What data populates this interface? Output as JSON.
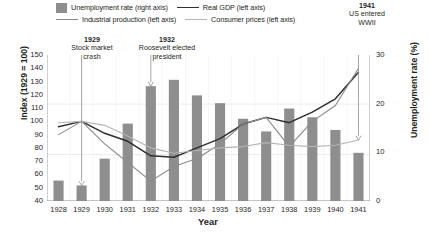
{
  "chart_data": {
    "type": "bar",
    "title": "",
    "xlabel": "Year",
    "ylabel": "Index (1929 = 100)",
    "ylabel_right": "Unemployment rate (%)",
    "categories": [
      "1928",
      "1929",
      "1930",
      "1931",
      "1932",
      "1933",
      "1934",
      "1935",
      "1936",
      "1937",
      "1938",
      "1939",
      "1940",
      "1941"
    ],
    "ylim": [
      40,
      150
    ],
    "ylim_right": [
      0,
      30
    ],
    "yticks": [
      40,
      50,
      60,
      70,
      80,
      90,
      100,
      110,
      120,
      130,
      140,
      150
    ],
    "yticks_right": [
      0,
      10,
      20,
      30
    ],
    "grid": true,
    "legend_position": "top",
    "series": [
      {
        "name": "Unemployment rate (right axis)",
        "type": "bar",
        "axis": "right",
        "color": "#8e8e8e",
        "values": [
          4.2,
          3.2,
          8.7,
          15.9,
          23.6,
          24.9,
          21.7,
          20.1,
          16.9,
          14.3,
          19.0,
          17.2,
          14.6,
          9.9
        ]
      },
      {
        "name": "Real GDP (left axis)",
        "type": "line",
        "axis": "left",
        "color": "#2f2f2f",
        "values": [
          96,
          100,
          91,
          85,
          74,
          73,
          80,
          87,
          98,
          103,
          99,
          107,
          117,
          137
        ]
      },
      {
        "name": "Industrial production (left axis)",
        "type": "line",
        "axis": "left",
        "color": "#8a8a8a",
        "values": [
          90,
          100,
          83,
          69,
          55,
          66,
          72,
          83,
          98,
          103,
          81,
          100,
          112,
          140
        ]
      },
      {
        "name": "Consumer prices (left axis)",
        "type": "line",
        "axis": "left",
        "color": "#b4b4b4",
        "values": [
          99,
          100,
          97,
          89,
          80,
          76,
          78,
          80,
          81,
          84,
          82,
          81,
          82,
          86
        ]
      }
    ],
    "annotations": [
      {
        "year": "1929",
        "line1": "Stock market",
        "line2": "crash"
      },
      {
        "year": "1932",
        "line1": "Roosevelt elected",
        "line2": "president"
      },
      {
        "year": "1941",
        "line1": "US entered",
        "line2": "WWII"
      }
    ]
  },
  "legend": {
    "items": [
      {
        "label": "Unemployment rate (right axis)"
      },
      {
        "label": "Real GDP (left axis)"
      },
      {
        "label": "Industrial production (left axis)"
      },
      {
        "label": "Consumer prices (left axis)"
      }
    ]
  },
  "axes": {
    "y_left_title": "Index (1929 = 100)",
    "y_right_title": "Unemployment rate (%)",
    "x_title": "Year"
  },
  "annotations": {
    "a1929": {
      "year": "1929",
      "line1": "Stock market",
      "line2": "crash"
    },
    "a1932": {
      "year": "1932",
      "line1": "Roosevelt elected",
      "line2": "president"
    },
    "a1941": {
      "year": "1941",
      "line1": "US entered",
      "line2": "WWII"
    }
  }
}
